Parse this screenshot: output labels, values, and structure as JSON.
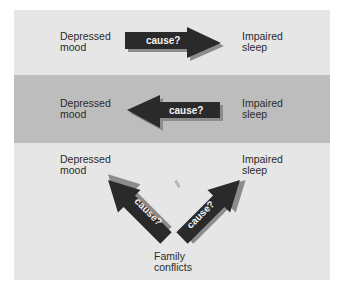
{
  "figure": {
    "colors": {
      "light_band": "#e6e6e6",
      "dark_band": "#bdbdbd",
      "arrow_fill": "#2a2a2a",
      "arrow_shadow": "#8c8c8c",
      "arrow_text": "#f4f4f4",
      "label_text": "#2b2b2b"
    },
    "panels": [
      {
        "id": "panel-1",
        "left_label": "Depressed\nmood",
        "right_label": "Impaired\nsleep",
        "arrow": {
          "direction": "right",
          "label": "cause?"
        }
      },
      {
        "id": "panel-2",
        "left_label": "Depressed\nmood",
        "right_label": "Impaired\nsleep",
        "arrow": {
          "direction": "left",
          "label": "cause?"
        }
      },
      {
        "id": "panel-3",
        "left_label": "Depressed\nmood",
        "right_label": "Impaired\nsleep",
        "bottom_label": "Family\nconflicts",
        "arrows": [
          {
            "direction": "up-left",
            "label": "cause?"
          },
          {
            "direction": "up-right",
            "label": "cause?"
          }
        ]
      }
    ]
  }
}
